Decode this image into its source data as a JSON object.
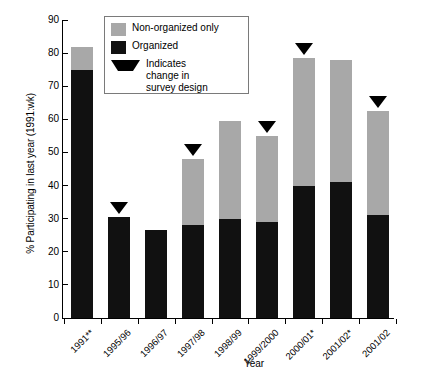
{
  "chart_data": {
    "type": "bar",
    "stacked": true,
    "title": "",
    "xlabel": "Year",
    "ylabel": "% Participating in last year (1991:wk)",
    "ylim": [
      0,
      90
    ],
    "yticks": [
      0,
      10,
      20,
      30,
      40,
      50,
      60,
      70,
      80,
      90
    ],
    "grid": false,
    "legend_position": "top-center-inside",
    "categories": [
      "1991**",
      "1995/96",
      "1996/97",
      "1997/98",
      "1998/99",
      "1999/2000",
      "2000/01*",
      "2001/02*",
      "2001/02"
    ],
    "series": [
      {
        "name": "Organized",
        "color": "#111111",
        "values": [
          75,
          30.5,
          26.5,
          28,
          30,
          29,
          40,
          41,
          31
        ]
      },
      {
        "name": "Non-organized only",
        "color": "#a8a8a8",
        "values": [
          7,
          0,
          0,
          20,
          29.5,
          26,
          38.5,
          37,
          31.5
        ]
      }
    ],
    "totals": [
      82,
      30.5,
      26.5,
      48,
      59.5,
      55,
      78.5,
      78,
      62.5
    ],
    "annotations": {
      "marker_symbol": "filled-down-triangle",
      "marker_meaning": "Indicates change in survey design",
      "marker_categories": [
        "1995/96",
        "1997/98",
        "1999/2000",
        "2000/01*",
        "2001/02"
      ]
    }
  },
  "legend": {
    "items": [
      {
        "key": "gray-swatch",
        "label": "Non-organized only"
      },
      {
        "key": "black-swatch",
        "label": "Organized"
      },
      {
        "key": "triangle-marker",
        "label": "Indicates"
      },
      {
        "key": "triangle-marker-line2",
        "label": "change in"
      },
      {
        "key": "triangle-marker-line3",
        "label": "survey design"
      }
    ]
  }
}
